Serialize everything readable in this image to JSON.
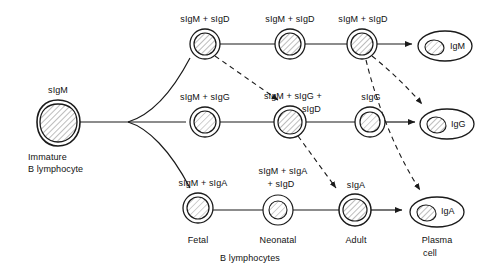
{
  "figure": {
    "caption": "B lymphocytes",
    "stroke_color": "#1a1a1a",
    "text_color": "#111111",
    "background": "#ffffff"
  },
  "precursor": {
    "surface_ig": "sIgM",
    "name_line1": "Immature",
    "name_line2": "B lymphocyte"
  },
  "stage_captions": {
    "fetal": "Fetal",
    "neonatal": "Neonatal",
    "adult": "Adult",
    "plasma_line1": "Plasma",
    "plasma_line2": "cell"
  },
  "rows": [
    {
      "id": "igd-row",
      "cells": [
        {
          "label": "sIgM + sIgD"
        },
        {
          "label": "sIgM + sIgD"
        },
        {
          "label": "sIgM + sIgD"
        }
      ],
      "plasma": {
        "label": "IgM"
      }
    },
    {
      "id": "igg-row",
      "cells": [
        {
          "label": "sIgM + sIgG"
        },
        {
          "label_line1": "sIgM + sIgG +",
          "label_line2": "sIgD"
        },
        {
          "label": "sIgG"
        }
      ],
      "plasma": {
        "label": "IgG"
      }
    },
    {
      "id": "iga-row",
      "cells": [
        {
          "label": "sIgM + sIgA"
        },
        {
          "label_line1": "sIgM + sIgA",
          "label_line2": "+ sIgD"
        },
        {
          "label": "sIgA"
        }
      ],
      "plasma": {
        "label": "IgA"
      }
    }
  ]
}
